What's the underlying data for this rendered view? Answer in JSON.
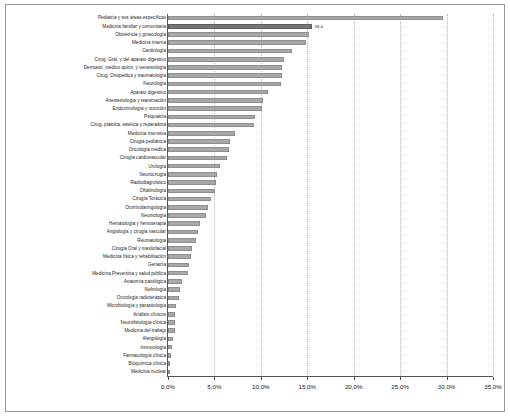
{
  "chart_data": {
    "type": "bar",
    "orientation": "horizontal",
    "title": "",
    "subtitle": "",
    "xlabel": "",
    "ylabel": "",
    "xlim": [
      0,
      35
    ],
    "xticks": [
      0,
      5,
      10,
      15,
      20,
      25,
      30,
      35
    ],
    "xtick_labels": [
      "0,0%",
      "5,0%",
      "10,0%",
      "15,0%",
      "20,0%",
      "25,0%",
      "30,0%",
      "35,0%"
    ],
    "grid": true,
    "grid_axis": "x",
    "legend": "none",
    "bar_color": "#a8a8a8",
    "highlight_color": "#767676",
    "highlighted_category": "Medicina familiar y comunitaria",
    "annotations": [
      {
        "text": "18,4",
        "category": "Medicina familiar y comunitaria"
      }
    ],
    "categories": [
      "Pediatría y sus áreas específicas",
      "Medicina familiar y comunitaria",
      "Obstetricia y ginecología",
      "Medicina interna",
      "Cardiología",
      "Cirug. Gral. y del aparato digestivo",
      "Dermatol. médico quirúr. y venereología",
      "Cirug. Ortopédica y traumatología",
      "Neurología",
      "Aparato digestivo",
      "Anestesiología y reanimación",
      "Endocrinología y nutrición",
      "Psiquiatría",
      "Cirug. plástica, estética y reparadora",
      "Medicina intensiva",
      "Cirugía pediátrica",
      "Oncología médica",
      "Cirugía cardiovascular",
      "Urología",
      "Neurocirugía",
      "Radiodiagnóstico",
      "Oftalmología",
      "Cirugía Torácica",
      "Otorrinolaringología",
      "Neumología",
      "Hematología y hemoterapia",
      "Angiología y cirugía vascular",
      "Reumatología",
      "Cirugía Oral y maxilofacial",
      "Medicina física y rehabilitación",
      "Geriatría",
      "Medicina Preventiva y salud pública",
      "Anatomía patológica",
      "Nefrología",
      "Oncología radioterápica",
      "Microbiología y parasitología",
      "Análisis clínicos",
      "Neurofisiología clínica",
      "Medicina del trabajo",
      "Alergología",
      "Inmunología",
      "Farmacología clínica",
      "Bioquímica clínica",
      "Medicina nuclear"
    ],
    "values": [
      29.6,
      15.5,
      15.2,
      14.9,
      13.3,
      12.5,
      12.3,
      12.3,
      12.2,
      10.8,
      10.2,
      10.1,
      9.4,
      9.3,
      7.2,
      6.7,
      6.6,
      6.3,
      5.6,
      5.3,
      5.2,
      5.1,
      4.6,
      4.3,
      4.1,
      3.4,
      3.2,
      3.0,
      2.6,
      2.5,
      2.3,
      2.2,
      1.5,
      1.3,
      1.2,
      0.9,
      0.8,
      0.7,
      0.7,
      0.5,
      0.4,
      0.3,
      0.2,
      0.1
    ]
  }
}
